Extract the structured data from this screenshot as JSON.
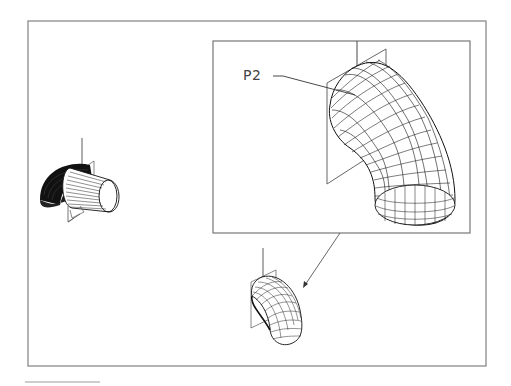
{
  "figure": {
    "type": "cad-wireframe-pipe-elbow",
    "colors": {
      "background": "#ffffff",
      "frame": "#8a8a8a",
      "wire": "#1a1a1a",
      "plane": "#555555",
      "label": "#444444"
    },
    "outer_frame": {
      "x": 28,
      "y": 21,
      "w": 458,
      "h": 345
    },
    "inset_frame": {
      "x": 213,
      "y": 41,
      "w": 257,
      "h": 192
    },
    "labels": {
      "p2": "P2"
    },
    "views": [
      {
        "name": "left-view",
        "description": "elbow with cutting plane, hatched cylinder end"
      },
      {
        "name": "inset-zoom-view",
        "description": "enlarged wireframe elbow with plane P2"
      },
      {
        "name": "bottom-view",
        "description": "small wireframe elbow with plane"
      }
    ],
    "arrow": {
      "from": [
        340,
        233
      ],
      "to": [
        304,
        287
      ]
    }
  }
}
